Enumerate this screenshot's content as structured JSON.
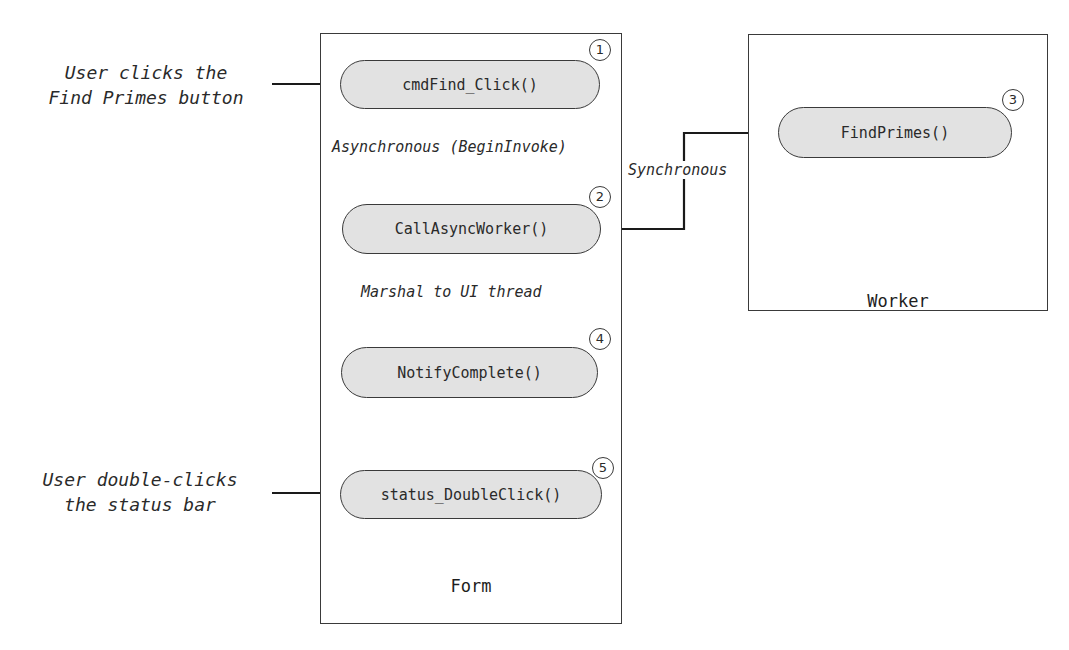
{
  "containers": {
    "form": {
      "title": "Form"
    },
    "worker": {
      "title": "Worker"
    }
  },
  "methods": [
    {
      "id": "cmdFind_Click",
      "label": "cmdFind_Click()",
      "step": "1",
      "container": "form"
    },
    {
      "id": "CallAsyncWorker",
      "label": "CallAsyncWorker()",
      "step": "2",
      "container": "form"
    },
    {
      "id": "FindPrimes",
      "label": "FindPrimes()",
      "step": "3",
      "container": "worker"
    },
    {
      "id": "NotifyComplete",
      "label": "NotifyComplete()",
      "step": "4",
      "container": "form"
    },
    {
      "id": "status_DoubleClick",
      "label": "status_DoubleClick()",
      "step": "5",
      "container": "form"
    }
  ],
  "external_events": [
    {
      "line1": "User clicks the",
      "line2": "Find Primes button",
      "target": "cmdFind_Click"
    },
    {
      "line1": "User double-clicks",
      "line2": "the status bar",
      "target": "status_DoubleClick"
    }
  ],
  "edges": [
    {
      "from": "cmdFind_Click",
      "to": "CallAsyncWorker",
      "label": "Asynchronous (BeginInvoke)"
    },
    {
      "from": "CallAsyncWorker",
      "to": "FindPrimes",
      "label": "Synchronous",
      "bidirectional": true
    },
    {
      "from": "CallAsyncWorker",
      "to": "NotifyComplete",
      "label": "Marshal to UI thread"
    }
  ],
  "colors": {
    "pill_fill": "#e2e2e2",
    "stroke": "#3a3a3a",
    "text": "#2a2a2a"
  }
}
